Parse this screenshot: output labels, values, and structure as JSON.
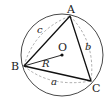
{
  "diagram": {
    "circle": {
      "cx": 62,
      "cy": 55,
      "r": 41,
      "center_label": "O"
    },
    "vertices": [
      {
        "name": "A",
        "x": 70,
        "y": 16,
        "label_x": 67,
        "label_y": 13
      },
      {
        "name": "B",
        "x": 24,
        "y": 66,
        "label_x": 11,
        "label_y": 70
      },
      {
        "name": "C",
        "x": 91,
        "y": 81,
        "label_x": 92,
        "label_y": 92
      }
    ],
    "center": {
      "name": "O",
      "x": 62,
      "y": 55,
      "label_x": 58,
      "label_y": 51
    },
    "radius_label": {
      "text": "R",
      "x": 42,
      "y": 67
    },
    "side_labels": [
      {
        "text": "a",
        "x": 51,
        "y": 85
      },
      {
        "text": "b",
        "x": 85,
        "y": 50
      },
      {
        "text": "c",
        "x": 37,
        "y": 33
      }
    ],
    "colors": {
      "stroke": "#222222",
      "dashed": "#888888",
      "background": "#ffffff"
    }
  }
}
